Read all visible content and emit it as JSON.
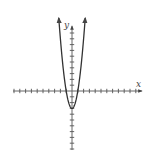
{
  "chart_data": {
    "type": "line",
    "title": "",
    "xlabel": "x",
    "ylabel": "y",
    "function": "y = 3x^2 - 3",
    "x": [
      -2.2,
      -2,
      -1.5,
      -1,
      -0.5,
      0,
      0.5,
      1,
      1.5,
      2,
      2.2
    ],
    "series": [
      {
        "name": "parabola",
        "values": [
          11.52,
          9,
          3.75,
          0,
          -2.25,
          -3,
          -2.25,
          0,
          3.75,
          9,
          11.52
        ]
      }
    ],
    "vertex": [
      0,
      -3
    ],
    "x_intercepts": [
      -1,
      1
    ],
    "xlim": [
      -11,
      11
    ],
    "ylim": [
      -10,
      11
    ],
    "x_ticks_left": 10,
    "x_ticks_right": 11,
    "grid": false,
    "legend": "none",
    "colors": {
      "axis": "#555555",
      "curve": "#333333"
    }
  },
  "labels": {
    "x_axis": "x",
    "y_axis": "y"
  }
}
